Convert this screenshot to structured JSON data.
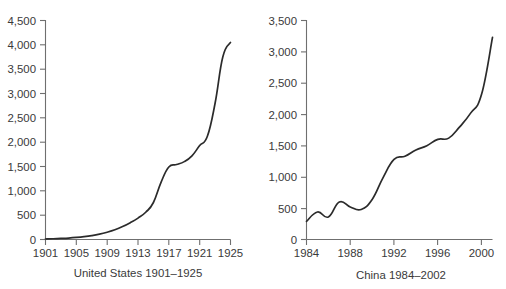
{
  "figure": {
    "background": "#ffffff",
    "line_color": "#2b2b2b",
    "axis_color": "#6f6f6f",
    "text_color": "#3a3a3a"
  },
  "chart_data": [
    {
      "type": "line",
      "title": "",
      "caption": "United States 1901–1925",
      "xlabel": "",
      "ylabel": "",
      "xlim": [
        1901,
        1925
      ],
      "ylim": [
        0,
        4500
      ],
      "grid": false,
      "legend": "none",
      "xticks": [
        1901,
        1905,
        1909,
        1913,
        1917,
        1921,
        1925
      ],
      "xtick_labels": [
        "1901",
        "1905",
        "1909",
        "1913",
        "1917",
        "1921",
        "1925"
      ],
      "yticks": [
        0,
        500,
        1000,
        1500,
        2000,
        2500,
        3000,
        3500,
        4000,
        4500
      ],
      "ytick_labels": [
        "0",
        "500",
        "1,000",
        "1,500",
        "2,000",
        "2,500",
        "3,000",
        "3,500",
        "4,000",
        "4,500"
      ],
      "x": [
        1901,
        1902,
        1903,
        1904,
        1905,
        1906,
        1907,
        1908,
        1909,
        1910,
        1911,
        1912,
        1913,
        1914,
        1915,
        1916,
        1917,
        1918,
        1919,
        1920,
        1921,
        1922,
        1923,
        1924,
        1925
      ],
      "values": [
        10,
        15,
        22,
        30,
        42,
        58,
        80,
        110,
        150,
        200,
        265,
        345,
        440,
        560,
        760,
        1180,
        1490,
        1540,
        1600,
        1720,
        1930,
        2120,
        2800,
        3750,
        4050
      ],
      "series_name": "United States"
    },
    {
      "type": "line",
      "title": "",
      "caption": "China 1984–2002",
      "xlabel": "",
      "ylabel": "",
      "xlim": [
        1984,
        2001
      ],
      "ylim": [
        0,
        3500
      ],
      "grid": false,
      "legend": "none",
      "xticks": [
        1984,
        1988,
        1992,
        1996,
        2000
      ],
      "xtick_labels": [
        "1984",
        "1988",
        "1992",
        "1996",
        "2000"
      ],
      "yticks": [
        0,
        500,
        1000,
        1500,
        2000,
        2500,
        3000,
        3500
      ],
      "ytick_labels": [
        "0",
        "500",
        "1,000",
        "1,500",
        "2,000",
        "2,500",
        "3,000",
        "3,500"
      ],
      "x": [
        1984,
        1985,
        1986,
        1987,
        1988,
        1989,
        1990,
        1991,
        1992,
        1993,
        1994,
        1995,
        1996,
        1997,
        1998,
        1999,
        2000,
        2001
      ],
      "values": [
        290,
        440,
        360,
        600,
        520,
        480,
        640,
        990,
        1280,
        1330,
        1430,
        1500,
        1600,
        1620,
        1800,
        2020,
        2320,
        3230
      ],
      "series_name": "China"
    }
  ]
}
